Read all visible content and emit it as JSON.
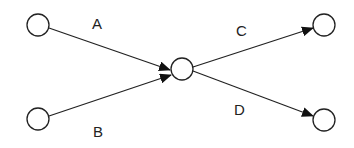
{
  "diagram": {
    "type": "directed-graph",
    "nodes": [
      {
        "id": "n1",
        "cx": 38,
        "cy": 25,
        "r": 11
      },
      {
        "id": "n2",
        "cx": 38,
        "cy": 119,
        "r": 11
      },
      {
        "id": "n3",
        "cx": 182,
        "cy": 69,
        "r": 11
      },
      {
        "id": "n4",
        "cx": 324,
        "cy": 25,
        "r": 11
      },
      {
        "id": "n5",
        "cx": 324,
        "cy": 120,
        "r": 11
      }
    ],
    "edges": [
      {
        "label": "A",
        "from": "n1",
        "to": "n3"
      },
      {
        "label": "B",
        "from": "n2",
        "to": "n3"
      },
      {
        "label": "C",
        "from": "n3",
        "to": "n4"
      },
      {
        "label": "D",
        "from": "n3",
        "to": "n5"
      }
    ],
    "labels": {
      "a": "A",
      "b": "B",
      "c": "C",
      "d": "D"
    },
    "colors": {
      "stroke": "#222222",
      "background": "#ffffff"
    }
  }
}
